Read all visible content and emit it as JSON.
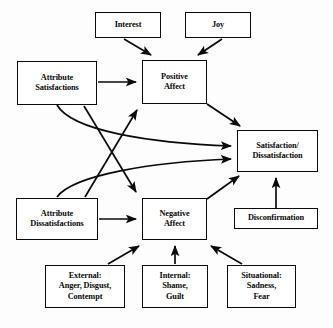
{
  "diagram": {
    "background_color": "#fdfdfd",
    "line_color": "#0a0a0a",
    "box_fill": "#ffffff",
    "nodes": [
      {
        "id": "interest",
        "label": "Interest",
        "x": 95,
        "y": 12,
        "w": 66,
        "h": 26
      },
      {
        "id": "joy",
        "label": "Joy",
        "x": 185,
        "y": 12,
        "w": 66,
        "h": 26
      },
      {
        "id": "attr_sat",
        "label": "Attribute\nSatisfactions",
        "x": 17,
        "y": 61,
        "w": 80,
        "h": 44
      },
      {
        "id": "positive_affect",
        "label": "Positive\nAffect",
        "x": 142,
        "y": 60,
        "w": 65,
        "h": 44
      },
      {
        "id": "sat_dissat",
        "label": "Satisfaction/\nDissatisfaction",
        "x": 237,
        "y": 130,
        "w": 81,
        "h": 42
      },
      {
        "id": "attr_dissat",
        "label": "Attribute\nDissatisfactions",
        "x": 16,
        "y": 198,
        "w": 82,
        "h": 42
      },
      {
        "id": "negative_affect",
        "label": "Negative\nAffect",
        "x": 142,
        "y": 198,
        "w": 65,
        "h": 42
      },
      {
        "id": "disconfirmation",
        "label": "Disconfirmation",
        "x": 234,
        "y": 208,
        "w": 84,
        "h": 21
      },
      {
        "id": "external",
        "label": "External:\nAnger, Disgust,\nContempt",
        "x": 45,
        "y": 265,
        "w": 80,
        "h": 43
      },
      {
        "id": "internal",
        "label": "Internal:\nShame,\nGuilt",
        "x": 142,
        "y": 265,
        "w": 66,
        "h": 43
      },
      {
        "id": "situational",
        "label": "Situational:\nSadness,\nFear",
        "x": 227,
        "y": 265,
        "w": 69,
        "h": 43
      }
    ],
    "edges": [
      {
        "id": "interest-to-positive",
        "from": "interest",
        "to": "positive_affect",
        "kind": "straight"
      },
      {
        "id": "joy-to-positive",
        "from": "joy",
        "to": "positive_affect",
        "kind": "straight"
      },
      {
        "id": "attrsat-to-positive",
        "from": "attr_sat",
        "to": "positive_affect",
        "kind": "straight"
      },
      {
        "id": "attrsat-to-negative",
        "from": "attr_sat",
        "to": "negative_affect",
        "kind": "straight"
      },
      {
        "id": "attrsat-to-satdissat",
        "from": "attr_sat",
        "to": "sat_dissat",
        "kind": "curve"
      },
      {
        "id": "attrdissat-to-negative",
        "from": "attr_dissat",
        "to": "negative_affect",
        "kind": "straight"
      },
      {
        "id": "attrdissat-to-positive",
        "from": "attr_dissat",
        "to": "positive_affect",
        "kind": "straight"
      },
      {
        "id": "attrdissat-to-satdissat",
        "from": "attr_dissat",
        "to": "sat_dissat",
        "kind": "curve"
      },
      {
        "id": "positive-to-satdissat",
        "from": "positive_affect",
        "to": "sat_dissat",
        "kind": "straight"
      },
      {
        "id": "negative-to-satdissat",
        "from": "negative_affect",
        "to": "sat_dissat",
        "kind": "straight"
      },
      {
        "id": "disconfirmation-to-satdissat",
        "from": "disconfirmation",
        "to": "sat_dissat",
        "kind": "straight"
      },
      {
        "id": "external-to-negative",
        "from": "external",
        "to": "negative_affect",
        "kind": "straight"
      },
      {
        "id": "internal-to-negative",
        "from": "internal",
        "to": "negative_affect",
        "kind": "straight"
      },
      {
        "id": "situational-to-negative",
        "from": "situational",
        "to": "negative_affect",
        "kind": "straight"
      }
    ]
  }
}
